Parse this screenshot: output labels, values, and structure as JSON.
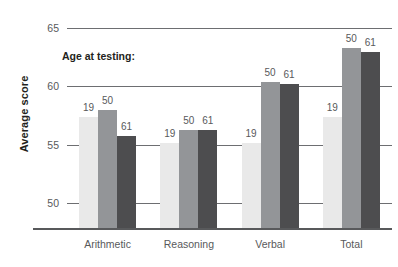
{
  "chart_data": {
    "type": "bar",
    "title": "",
    "subtitle": "",
    "xlabel": "",
    "ylabel": "Average score",
    "legend_title": "Age at testing:",
    "legend_position": "inside-top-left",
    "grid": true,
    "categories": [
      "Arithmetic",
      "Reasoning",
      "Verbal",
      "Total"
    ],
    "ylim": [
      47.9,
      65.5
    ],
    "yticks": [
      50,
      55,
      60,
      65
    ],
    "ytick_labels": [
      "50",
      "55",
      "60",
      "65"
    ],
    "series": [
      {
        "name": "19",
        "label": "19",
        "color": "#e9e9e9",
        "values": [
          57.4,
          55.2,
          55.2,
          57.4
        ]
      },
      {
        "name": "50",
        "label": "50",
        "color": "#939598",
        "values": [
          58.0,
          56.3,
          60.4,
          63.3
        ]
      },
      {
        "name": "61",
        "label": "61",
        "color": "#4d4d4f",
        "values": [
          55.8,
          56.3,
          60.2,
          62.9
        ]
      }
    ],
    "bar_labels": [
      [
        "19",
        "50",
        "61"
      ],
      [
        "19",
        "50",
        "61"
      ],
      [
        "19",
        "50",
        "61"
      ],
      [
        "19",
        "50",
        "61"
      ]
    ]
  },
  "axis": {
    "y_title": "Average score"
  }
}
